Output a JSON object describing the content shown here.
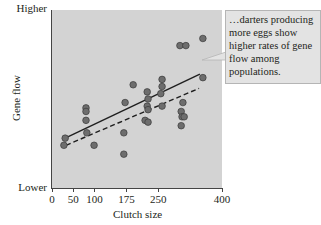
{
  "chart_data": {
    "type": "scatter",
    "title": "",
    "xlabel": "Clutch size",
    "ylabel": "Gene flow",
    "xlim": [
      0,
      400
    ],
    "ylim": [
      0,
      1
    ],
    "x_ticks": [
      0,
      50,
      100,
      175,
      250,
      400
    ],
    "x_tick_labels": [
      "0",
      "50",
      "100",
      "175",
      "250",
      "400"
    ],
    "y_tick_labels": {
      "low": "Lower",
      "high": "Higher"
    },
    "grid": false,
    "legend": null,
    "points": [
      {
        "x": 31,
        "y": 0.28
      },
      {
        "x": 28,
        "y": 0.24
      },
      {
        "x": 80,
        "y": 0.45
      },
      {
        "x": 80,
        "y": 0.43
      },
      {
        "x": 80,
        "y": 0.38
      },
      {
        "x": 82,
        "y": 0.31
      },
      {
        "x": 99,
        "y": 0.24
      },
      {
        "x": 169,
        "y": 0.31
      },
      {
        "x": 169,
        "y": 0.19
      },
      {
        "x": 172,
        "y": 0.48
      },
      {
        "x": 191,
        "y": 0.58
      },
      {
        "x": 224,
        "y": 0.54
      },
      {
        "x": 226,
        "y": 0.5
      },
      {
        "x": 224,
        "y": 0.46
      },
      {
        "x": 226,
        "y": 0.44
      },
      {
        "x": 219,
        "y": 0.38
      },
      {
        "x": 226,
        "y": 0.37
      },
      {
        "x": 259,
        "y": 0.61
      },
      {
        "x": 259,
        "y": 0.57
      },
      {
        "x": 256,
        "y": 0.53
      },
      {
        "x": 259,
        "y": 0.46
      },
      {
        "x": 301,
        "y": 0.8
      },
      {
        "x": 315,
        "y": 0.8
      },
      {
        "x": 355,
        "y": 0.84
      },
      {
        "x": 355,
        "y": 0.62
      },
      {
        "x": 308,
        "y": 0.48
      },
      {
        "x": 304,
        "y": 0.43
      },
      {
        "x": 306,
        "y": 0.4
      },
      {
        "x": 311,
        "y": 0.4
      },
      {
        "x": 304,
        "y": 0.35
      }
    ],
    "lines": [
      {
        "name": "solid-regression",
        "style": "solid",
        "from": {
          "x": 31,
          "y": 0.28
        },
        "to": {
          "x": 348,
          "y": 0.64
        }
      },
      {
        "name": "dashed-regression",
        "style": "dashed",
        "from": {
          "x": 33,
          "y": 0.24
        },
        "to": {
          "x": 346,
          "y": 0.56
        }
      }
    ],
    "annotations": [
      {
        "text": "…darters producing more eggs show higher rates of gene flow among populations."
      }
    ]
  },
  "labels": {
    "y_high": "Higher",
    "y_low": "Lower",
    "y_title": "Gene flow",
    "x_title": "Clutch size",
    "callout": "…darters producing more eggs show higher rates of gene flow among populations."
  },
  "colors": {
    "plot_bg": "#d3d3d3",
    "point_fill": "#6d6d6d",
    "point_stroke": "#3a3a3a",
    "line": "#1f1f1f",
    "callout_bg": "#e3e3e3"
  }
}
